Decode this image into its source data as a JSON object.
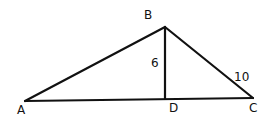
{
  "diagram": {
    "points": {
      "A": {
        "label": "A",
        "x": 25,
        "y": 101
      },
      "B": {
        "label": "B",
        "x": 165,
        "y": 27
      },
      "C": {
        "label": "C",
        "x": 253,
        "y": 98
      },
      "D": {
        "label": "D",
        "x": 165,
        "y": 99
      }
    },
    "segments": [
      {
        "from": "A",
        "to": "B"
      },
      {
        "from": "B",
        "to": "C"
      },
      {
        "from": "A",
        "to": "C"
      },
      {
        "from": "B",
        "to": "D"
      }
    ],
    "measurements": {
      "BD": "6",
      "BC": "10"
    },
    "colors": {
      "stroke": "#111111",
      "background": "#ffffff"
    }
  }
}
